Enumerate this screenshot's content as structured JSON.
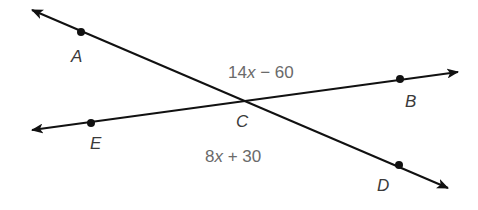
{
  "diagram": {
    "type": "intersecting-lines",
    "colors": {
      "line": "#111111",
      "label": "#3a3a3a",
      "expression": "#6a6a6a",
      "background": "#ffffff"
    },
    "lines": [
      {
        "name": "line-AD",
        "from": [
          32,
          10
        ],
        "to": [
          448,
          188
        ],
        "both_arrows": true
      },
      {
        "name": "line-EB",
        "from": [
          32,
          130
        ],
        "to": [
          458,
          72
        ],
        "both_arrows": true
      }
    ],
    "points": [
      {
        "id": "A",
        "label": "A",
        "dot": [
          81,
          32
        ],
        "label_pos": [
          71,
          62
        ]
      },
      {
        "id": "B",
        "label": "B",
        "dot": [
          400,
          79
        ],
        "label_pos": [
          405,
          107
        ]
      },
      {
        "id": "C",
        "label": "C",
        "dot": null,
        "label_pos": [
          236,
          127
        ]
      },
      {
        "id": "D",
        "label": "D",
        "dot": [
          399,
          165
        ],
        "label_pos": [
          377,
          191
        ]
      },
      {
        "id": "E",
        "label": "E",
        "dot": [
          91,
          123
        ],
        "label_pos": [
          90,
          149
        ]
      }
    ],
    "angle_expressions": [
      {
        "id": "angle-ACB",
        "coef": "14",
        "var": "x",
        "rest": " − 60",
        "pos": [
          228,
          78
        ]
      },
      {
        "id": "angle-ECD",
        "coef": "8",
        "var": "x",
        "rest": " + 30",
        "pos": [
          205,
          162
        ]
      }
    ]
  }
}
